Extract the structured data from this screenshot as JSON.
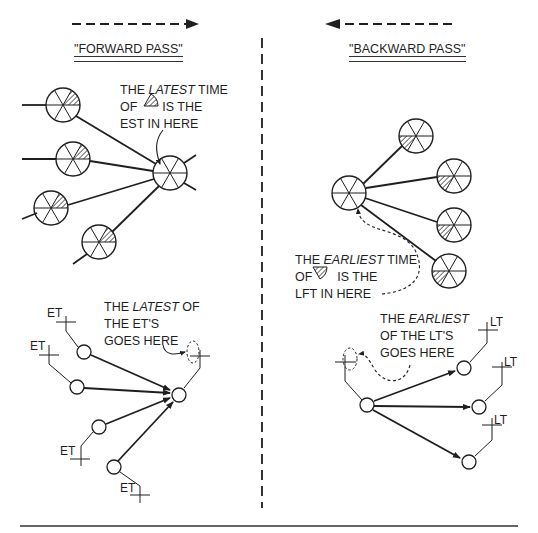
{
  "forward": {
    "title": "\"FORWARD PASS\"",
    "arrow_direction": "right",
    "annotation_top": {
      "line1_pre": "THE ",
      "line1_em": "LATEST",
      "line1_post": " TIME",
      "line2_pre": "OF ",
      "line2_post": " IS THE",
      "line3": "EST IN HERE"
    },
    "annotation_bottom": {
      "line1_pre": "THE ",
      "line1_em": "LATEST",
      "line1_post": " OF",
      "line2": "THE ET'S",
      "line3": "GOES HERE"
    },
    "et_labels": [
      "ET",
      "ET",
      "ET",
      "ET"
    ]
  },
  "backward": {
    "title": "\"BACKWARD PASS\"",
    "arrow_direction": "left",
    "annotation_top": {
      "line1_pre": "THE ",
      "line1_em": "EARLIEST",
      "line1_post": " TIME",
      "line2_pre": "OF ",
      "line2_post": " IS THE",
      "line3": "LFT IN HERE"
    },
    "annotation_bottom": {
      "line1_pre": "THE ",
      "line1_em": "EARLIEST",
      "line2": "OF THE LT'S",
      "line3": "GOES HERE"
    },
    "lt_labels": [
      "LT",
      "LT",
      "LT"
    ]
  },
  "colors": {
    "ink": "#1f1f1f",
    "background": "#ffffff"
  }
}
